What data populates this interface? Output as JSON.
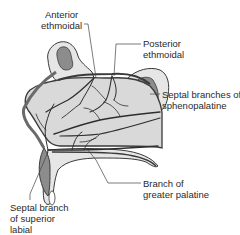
{
  "figure": {
    "colors": {
      "septum_fill": "#d9d9d9",
      "bone_fill": "#e6e6e6",
      "sinus_fill": "#8c8c8c",
      "outline": "#3a3a3a",
      "vessel": "#2e2e2e",
      "leader_line": "#444444",
      "text": "#2a2a2a"
    }
  },
  "labels": {
    "anterior_ethmoidal": {
      "line1": "Anterior",
      "line2": "ethmoidal"
    },
    "posterior_ethmoidal": {
      "line1": "Posterior",
      "line2": "ethmoidal"
    },
    "septal_branches_sphenopalatine": {
      "line1": "Septal branches of",
      "line2": "sphenopalatine"
    },
    "septal_branch_superior_labial": {
      "line1": "Septal branch",
      "line2": "of superior",
      "line3": "labial"
    },
    "branch_greater_palatine": {
      "line1": "Branch of",
      "line2": "greater palatine"
    }
  }
}
